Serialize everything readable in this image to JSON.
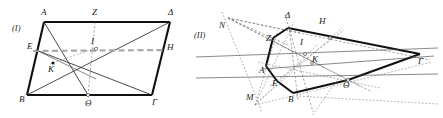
{
  "figure": {
    "panels": [
      {
        "id": "panel-1",
        "label": "(I)",
        "x": 12,
        "y": 31
      },
      {
        "id": "panel-2",
        "label": "(II)",
        "x": 194,
        "y": 38
      }
    ],
    "colors": {
      "ink": "#111111",
      "thin_ink": "#2b2b2b",
      "gray_dash": "#a9a9a9",
      "fine_dash": "#6e6e6e",
      "background": "#ffffff"
    },
    "panel_1": {
      "name": "parallelogram-figure",
      "outline_points": "44,22 170,22 152,95 27,95",
      "vertices": [
        {
          "name": "A",
          "label": "Α",
          "px": 44,
          "py": 22,
          "lx": 41,
          "ly": 15
        },
        {
          "name": "Z",
          "label": "Ζ",
          "px": 95,
          "py": 22,
          "lx": 92,
          "ly": 15
        },
        {
          "name": "D",
          "label": "Δ",
          "px": 170,
          "py": 22,
          "lx": 168,
          "ly": 15
        },
        {
          "name": "E",
          "label": "Ε",
          "px": 36,
          "py": 50,
          "lx": 27,
          "ly": 49
        },
        {
          "name": "I",
          "label": "Ι",
          "px": 96,
          "py": 49,
          "lx": 91,
          "ly": 44
        },
        {
          "name": "H",
          "label": "Η",
          "px": 162,
          "py": 50,
          "lx": 167,
          "ly": 50
        },
        {
          "name": "K",
          "label": "Κ",
          "px": 53,
          "py": 63,
          "lx": 48,
          "ly": 72
        },
        {
          "name": "B",
          "label": "Β",
          "px": 27,
          "py": 95,
          "lx": 19,
          "ly": 102
        },
        {
          "name": "Th",
          "label": "Θ",
          "px": 88,
          "py": 95,
          "lx": 85,
          "ly": 106
        },
        {
          "name": "G",
          "label": "Γ",
          "px": 152,
          "py": 95,
          "lx": 152,
          "ly": 105
        }
      ],
      "segments": [
        {
          "name": "side-AD",
          "from": [
            44,
            22
          ],
          "to": [
            170,
            22
          ],
          "style": "solid-thick"
        },
        {
          "name": "side-AB",
          "from": [
            44,
            22
          ],
          "to": [
            27,
            95
          ],
          "style": "solid-thick"
        },
        {
          "name": "side-BG",
          "from": [
            27,
            95
          ],
          "to": [
            152,
            95
          ],
          "style": "solid-thick"
        },
        {
          "name": "side-DG",
          "from": [
            170,
            22
          ],
          "to": [
            152,
            95
          ],
          "style": "solid-thick"
        },
        {
          "name": "diag-A-Theta",
          "from": [
            44,
            22
          ],
          "to": [
            88,
            95
          ],
          "style": "solid-thin"
        },
        {
          "name": "line-Z-Theta",
          "from": [
            95,
            22
          ],
          "to": [
            88,
            95
          ],
          "style": "dash-fine"
        },
        {
          "name": "line-E-Gamma",
          "from": [
            36,
            50
          ],
          "to": [
            152,
            95
          ],
          "style": "solid-thin"
        },
        {
          "name": "line-B-Delta",
          "from": [
            27,
            95
          ],
          "to": [
            170,
            22
          ],
          "style": "solid-thin"
        },
        {
          "name": "line-E-H",
          "from": [
            33,
            51
          ],
          "to": [
            166,
            50
          ],
          "style": "dashed-gray"
        },
        {
          "name": "line-K-I",
          "from": [
            50,
            64
          ],
          "to": [
            99,
            47
          ],
          "style": "dash-fine2"
        },
        {
          "name": "line-E-K-span",
          "from": [
            36,
            50
          ],
          "to": [
            96,
            79
          ],
          "style": "solid-hair"
        }
      ],
      "marked_points": [
        {
          "name": "point-I",
          "cx": 96,
          "cy": 49,
          "r": 1.6,
          "open": true
        },
        {
          "name": "point-K",
          "cx": 53,
          "cy": 63,
          "r": 1.5,
          "open": false
        },
        {
          "name": "point-Theta",
          "cx": 88,
          "cy": 95,
          "r": 1.6,
          "open": true
        }
      ]
    },
    "panel_2": {
      "name": "projective-figure",
      "outline_points": "288,28 420,54 348,80 293,93 277,81 266,66 273,38",
      "vertices": [
        {
          "name": "N",
          "label": "Ν",
          "px": 228,
          "py": 18,
          "lx": 219,
          "ly": 28
        },
        {
          "name": "D",
          "label": "Δ",
          "px": 288,
          "py": 28,
          "lx": 285,
          "ly": 18
        },
        {
          "name": "H",
          "label": "Η",
          "px": 330,
          "py": 38,
          "lx": 319,
          "ly": 24
        },
        {
          "name": "Z",
          "label": "Ζ",
          "px": 273,
          "py": 38,
          "lx": 266,
          "ly": 41
        },
        {
          "name": "I",
          "label": "Ι",
          "px": 305,
          "py": 54,
          "lx": 300,
          "ly": 45
        },
        {
          "name": "G",
          "label": "Γ",
          "px": 420,
          "py": 54,
          "lx": 418,
          "ly": 64
        },
        {
          "name": "K",
          "label": "Κ",
          "px": 312,
          "py": 63,
          "lx": 312,
          "ly": 62
        },
        {
          "name": "A",
          "label": "Α",
          "px": 266,
          "py": 66,
          "lx": 259,
          "ly": 73
        },
        {
          "name": "E",
          "label": "Ε",
          "px": 277,
          "py": 81,
          "lx": 272,
          "ly": 86
        },
        {
          "name": "Th",
          "label": "Θ",
          "px": 348,
          "py": 80,
          "lx": 343,
          "ly": 88
        },
        {
          "name": "B",
          "label": "Β",
          "px": 293,
          "py": 93,
          "lx": 288,
          "ly": 102
        },
        {
          "name": "M",
          "label": "Μ",
          "px": 255,
          "py": 105,
          "lx": 246,
          "ly": 100
        }
      ],
      "segments": [
        {
          "name": "side-Delta-Gamma",
          "from": [
            288,
            28
          ],
          "to": [
            420,
            54
          ],
          "style": "solid-thick"
        },
        {
          "name": "side-Gamma-Theta",
          "from": [
            420,
            54
          ],
          "to": [
            348,
            80
          ],
          "style": "solid-thick"
        },
        {
          "name": "side-Theta-B",
          "from": [
            348,
            80
          ],
          "to": [
            293,
            93
          ],
          "style": "solid-thick"
        },
        {
          "name": "side-B-E",
          "from": [
            293,
            93
          ],
          "to": [
            277,
            81
          ],
          "style": "solid-thick"
        },
        {
          "name": "side-E-A",
          "from": [
            277,
            81
          ],
          "to": [
            266,
            66
          ],
          "style": "solid-thick"
        },
        {
          "name": "side-A-Z",
          "from": [
            266,
            66
          ],
          "to": [
            273,
            38
          ],
          "style": "solid-thick"
        },
        {
          "name": "side-Z-Delta",
          "from": [
            273,
            38
          ],
          "to": [
            288,
            28
          ],
          "style": "solid-thick"
        },
        {
          "name": "pencil-N-Delta",
          "from": [
            228,
            18
          ],
          "to": [
            300,
            33
          ],
          "style": "dash-fine"
        },
        {
          "name": "pencil-N-Z",
          "from": [
            228,
            18
          ],
          "to": [
            290,
            46
          ],
          "style": "dash-fine"
        },
        {
          "name": "pencil-N-K",
          "from": [
            228,
            18
          ],
          "to": [
            325,
            68
          ],
          "style": "dash-fine"
        },
        {
          "name": "pencil-N-Theta",
          "from": [
            228,
            18
          ],
          "to": [
            360,
            86
          ],
          "style": "dash-fine"
        },
        {
          "name": "pencil-N-Gamma",
          "from": [
            228,
            18
          ],
          "to": [
            430,
            60
          ],
          "style": "dash-fine"
        },
        {
          "name": "pencil-M-Delta",
          "from": [
            255,
            105
          ],
          "to": [
            294,
            22
          ],
          "style": "dash-fine2"
        },
        {
          "name": "pencil-M-Z",
          "from": [
            255,
            105
          ],
          "to": [
            278,
            30
          ],
          "style": "dash-fine2"
        },
        {
          "name": "pencil-M-I",
          "from": [
            255,
            105
          ],
          "to": [
            318,
            44
          ],
          "style": "dash-fine2"
        },
        {
          "name": "pencil-M-H",
          "from": [
            255,
            105
          ],
          "to": [
            342,
            28
          ],
          "style": "dash-fine2"
        },
        {
          "name": "pencil-M-Gamma",
          "from": [
            255,
            105
          ],
          "to": [
            432,
            62
          ],
          "style": "dash-fine2"
        },
        {
          "name": "ray-Delta-down",
          "from": [
            285,
            14
          ],
          "to": [
            313,
            112
          ],
          "style": "dash-fine"
        },
        {
          "name": "ray-transversal-1",
          "from": [
            196,
            57
          ],
          "to": [
            438,
            48
          ],
          "style": "solid-hair"
        },
        {
          "name": "ray-transversal-2",
          "from": [
            196,
            78
          ],
          "to": [
            438,
            74
          ],
          "style": "solid-hair"
        },
        {
          "name": "ray-A-Gamma",
          "from": [
            262,
            69
          ],
          "to": [
            434,
            56
          ],
          "style": "solid-hair"
        },
        {
          "name": "ray-Z-Theta",
          "from": [
            271,
            40
          ],
          "to": [
            372,
            92
          ],
          "style": "dash-fine"
        },
        {
          "name": "ray-Delta-B",
          "from": [
            289,
            26
          ],
          "to": [
            298,
            100
          ],
          "style": "dash-fine"
        },
        {
          "name": "ray-E-H",
          "from": [
            270,
            86
          ],
          "to": [
            344,
            30
          ],
          "style": "dash-fine"
        },
        {
          "name": "ray-A-Theta",
          "from": [
            258,
            62
          ],
          "to": [
            380,
            88
          ],
          "style": "dash-fine2"
        },
        {
          "name": "ray-N-M",
          "from": [
            222,
            12
          ],
          "to": [
            262,
            112
          ],
          "style": "dash-fine2"
        },
        {
          "name": "ray-B-right",
          "from": [
            296,
            96
          ],
          "to": [
            438,
            104
          ],
          "style": "dash-fine2"
        },
        {
          "name": "ray-Theta-down",
          "from": [
            340,
            76
          ],
          "to": [
            312,
            116
          ],
          "style": "dash-fine2"
        }
      ],
      "marked_points": [
        {
          "name": "point-I-2",
          "cx": 305,
          "cy": 54,
          "r": 1.5,
          "open": true
        },
        {
          "name": "point-K-2",
          "cx": 312,
          "cy": 63,
          "r": 1.4,
          "open": true
        },
        {
          "name": "point-H-2",
          "cx": 330,
          "cy": 38,
          "r": 1.4,
          "open": true
        },
        {
          "name": "point-Theta-2",
          "cx": 348,
          "cy": 80,
          "r": 1.5,
          "open": true
        }
      ]
    }
  }
}
